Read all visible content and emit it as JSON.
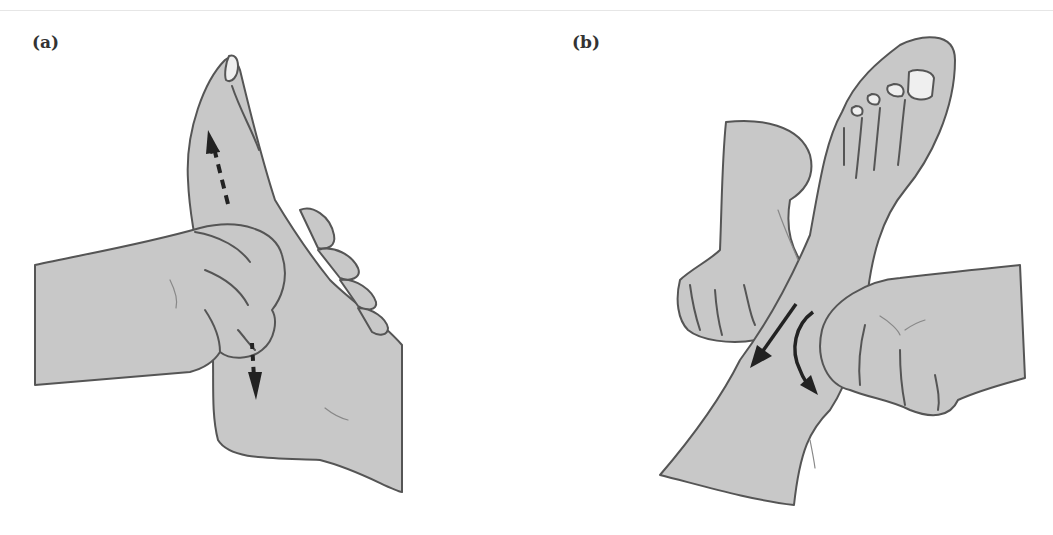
{
  "figure": {
    "panels": [
      {
        "label": "(a)",
        "subject": "hand holding foot sole, thumb stroking along sole",
        "arrows": [
          {
            "style": "dashed",
            "direction": "up-toward-toes"
          },
          {
            "style": "dashed",
            "direction": "down-toward-heel"
          }
        ]
      },
      {
        "label": "(b)",
        "subject": "two hands working on ankle/lower leg of raised foot",
        "arrows": [
          {
            "style": "solid-straight",
            "direction": "down-left"
          },
          {
            "style": "solid-curved",
            "direction": "down-right"
          }
        ]
      }
    ],
    "colors": {
      "skin_fill": "#c8c8c8",
      "outline": "#555555",
      "nail_fill": "#efefef",
      "arrow": "#222222",
      "background": "#ffffff"
    }
  }
}
